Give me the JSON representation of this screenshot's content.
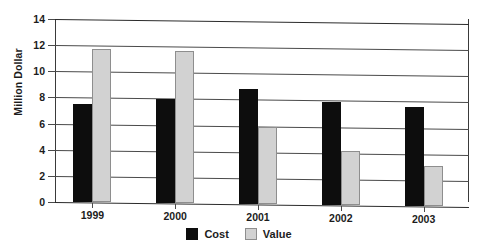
{
  "chart_data": {
    "type": "bar",
    "title": "",
    "xlabel": "",
    "ylabel": "Million Dollar",
    "categories": [
      "1999",
      "2000",
      "2001",
      "2002",
      "2003"
    ],
    "series": [
      {
        "name": "Cost",
        "color": "#0d0d0d",
        "values": [
          7.5,
          8.0,
          8.8,
          7.9,
          7.6
        ]
      },
      {
        "name": "Value",
        "color": "#d2d2d2",
        "values": [
          11.75,
          11.65,
          5.9,
          4.2,
          3.1
        ]
      }
    ],
    "ylim": [
      0,
      14
    ],
    "yticks": [
      "0",
      "2",
      "4",
      "6",
      "8",
      "10",
      "12",
      "14"
    ],
    "ytick_values": [
      0,
      2,
      4,
      6,
      8,
      10,
      12,
      14
    ],
    "grid": true,
    "legend_position": "bottom"
  },
  "legend": {
    "items": [
      {
        "label": "Cost"
      },
      {
        "label": "Value"
      }
    ]
  }
}
